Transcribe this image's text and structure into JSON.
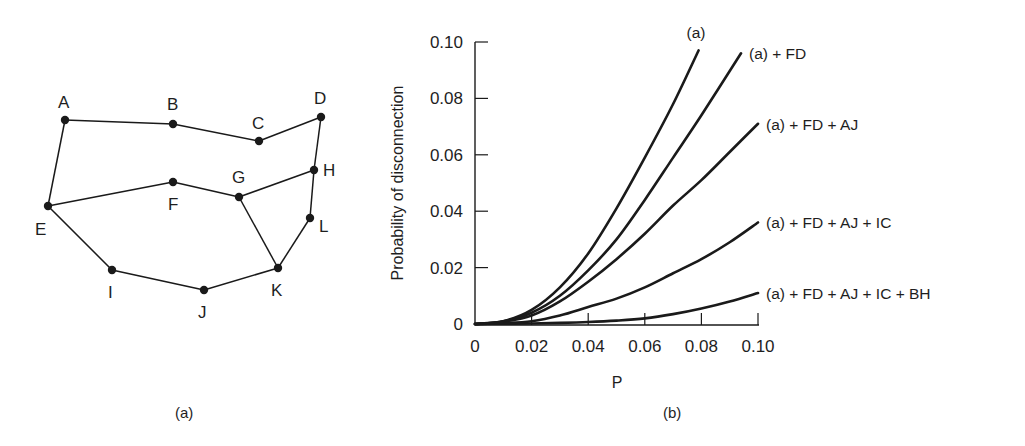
{
  "graph": {
    "caption": "(a)",
    "nodes": [
      {
        "id": "A",
        "x": 65,
        "y": 120,
        "lx": 58,
        "ly": 108
      },
      {
        "id": "B",
        "x": 173,
        "y": 124,
        "lx": 167,
        "ly": 110
      },
      {
        "id": "C",
        "x": 259,
        "y": 141,
        "lx": 252,
        "ly": 129
      },
      {
        "id": "D",
        "x": 321,
        "y": 117,
        "lx": 314,
        "ly": 104
      },
      {
        "id": "E",
        "x": 48,
        "y": 206,
        "lx": 35,
        "ly": 235
      },
      {
        "id": "F",
        "x": 173,
        "y": 182,
        "lx": 168,
        "ly": 210
      },
      {
        "id": "G",
        "x": 239,
        "y": 197,
        "lx": 232,
        "ly": 183
      },
      {
        "id": "H",
        "x": 314,
        "y": 170,
        "lx": 323,
        "ly": 176
      },
      {
        "id": "I",
        "x": 112,
        "y": 270,
        "lx": 108,
        "ly": 298
      },
      {
        "id": "J",
        "x": 204,
        "y": 290,
        "lx": 198,
        "ly": 318
      },
      {
        "id": "K",
        "x": 278,
        "y": 268,
        "lx": 271,
        "ly": 296
      },
      {
        "id": "L",
        "x": 310,
        "y": 218,
        "lx": 319,
        "ly": 232
      }
    ],
    "edges": [
      [
        "A",
        "B"
      ],
      [
        "B",
        "C"
      ],
      [
        "C",
        "D"
      ],
      [
        "D",
        "H"
      ],
      [
        "H",
        "L"
      ],
      [
        "L",
        "K"
      ],
      [
        "A",
        "E"
      ],
      [
        "E",
        "F"
      ],
      [
        "F",
        "G"
      ],
      [
        "G",
        "H"
      ],
      [
        "G",
        "K"
      ],
      [
        "E",
        "I"
      ],
      [
        "I",
        "J"
      ],
      [
        "J",
        "K"
      ]
    ]
  },
  "chart_data": {
    "type": "line",
    "caption": "(b)",
    "title": "",
    "xlabel": "P",
    "ylabel": "Probability of disconnection",
    "xlim": [
      0,
      0.1
    ],
    "ylim": [
      0,
      0.1
    ],
    "xticks": [
      "0",
      "0.02",
      "0.04",
      "0.06",
      "0.08",
      "0.10"
    ],
    "yticks": [
      "0",
      "0.02",
      "0.04",
      "0.06",
      "0.08",
      "0.10"
    ],
    "grid": false,
    "legend_position": "inline labels at curve ends",
    "series": [
      {
        "name": "(a)",
        "x": [
          0,
          0.01,
          0.02,
          0.03,
          0.04,
          0.05,
          0.06,
          0.07,
          0.079
        ],
        "y": [
          0,
          0.001,
          0.005,
          0.013,
          0.025,
          0.041,
          0.059,
          0.078,
          0.097
        ]
      },
      {
        "name": "(a) + FD",
        "x": [
          0,
          0.01,
          0.02,
          0.03,
          0.04,
          0.05,
          0.06,
          0.07,
          0.08,
          0.094
        ],
        "y": [
          0,
          0.001,
          0.004,
          0.01,
          0.019,
          0.03,
          0.044,
          0.059,
          0.074,
          0.096
        ]
      },
      {
        "name": "(a) + FD + AJ",
        "x": [
          0,
          0.01,
          0.02,
          0.03,
          0.04,
          0.05,
          0.06,
          0.07,
          0.08,
          0.09,
          0.1
        ],
        "y": [
          0,
          0.0008,
          0.003,
          0.008,
          0.015,
          0.023,
          0.032,
          0.042,
          0.051,
          0.061,
          0.071
        ]
      },
      {
        "name": "(a) + FD + AJ + IC",
        "x": [
          0,
          0.01,
          0.02,
          0.03,
          0.04,
          0.05,
          0.06,
          0.07,
          0.08,
          0.09,
          0.1
        ],
        "y": [
          0,
          0.0003,
          0.001,
          0.003,
          0.006,
          0.009,
          0.013,
          0.018,
          0.023,
          0.029,
          0.036
        ]
      },
      {
        "name": "(a) + FD + AJ + IC + BH",
        "x": [
          0,
          0.01,
          0.02,
          0.03,
          0.04,
          0.05,
          0.06,
          0.07,
          0.08,
          0.09,
          0.1
        ],
        "y": [
          0,
          0.0001,
          0.0002,
          0.0004,
          0.0007,
          0.0012,
          0.002,
          0.0035,
          0.0055,
          0.008,
          0.011
        ]
      }
    ]
  }
}
